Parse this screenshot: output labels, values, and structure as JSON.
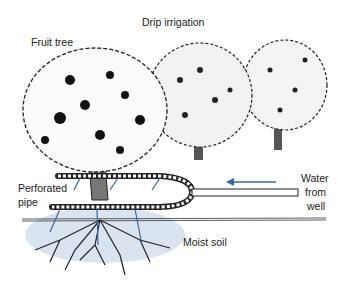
{
  "diagram": {
    "title": "Drip irrigation",
    "labels": {
      "fruit_tree": "Fruit tree",
      "perforated_pipe_line1": "Perforated",
      "perforated_pipe_line2": "pipe",
      "water_line1": "Water",
      "water_line2": "from",
      "water_line3": "well",
      "moist_soil": "Moist soil"
    },
    "colors": {
      "ink": "#1a1a1a",
      "water_arrow": "#3a64a8",
      "moist_soil": "#c9d8ea",
      "background": "#ffffff"
    }
  }
}
